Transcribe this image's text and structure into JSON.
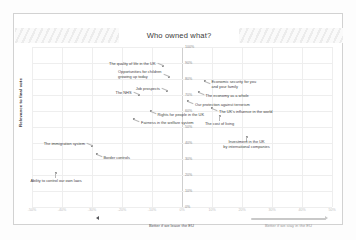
{
  "slide": {
    "title": "Who owned what?"
  },
  "axes": {
    "y_title": "Relevance to final vote",
    "y_ticks": [
      "100%",
      "90%",
      "80%",
      "70%",
      "60%",
      "50%",
      "40%",
      "30%",
      "20%",
      "10%",
      "0%"
    ],
    "y_min": 0,
    "y_max": 100,
    "x_ticks": [
      "-50%",
      "-40%",
      "-30%",
      "-20%",
      "-10%",
      "0%",
      "10%",
      "20%",
      "30%",
      "40%",
      "50%"
    ],
    "x_min": -50,
    "x_max": 50
  },
  "arrows": {
    "leave": {
      "label": "Better if we leave the EU",
      "color": "#55565a"
    },
    "stay": {
      "label": "Better if we stay in the EU",
      "color": "#c9c9c9"
    }
  },
  "chart_data": {
    "type": "scatter",
    "title": "Who owned what?",
    "xlabel": "",
    "ylabel": "Relevance to final vote",
    "xlim": [
      -50,
      50
    ],
    "ylim": [
      0,
      100
    ],
    "grid": true,
    "legend": "none",
    "points": [
      {
        "label": "The quality of life in the UK",
        "x": -6.5,
        "y": 88,
        "label_side": "left"
      },
      {
        "label": "Opportunities for children growing up today",
        "x": -4.5,
        "y": 81,
        "label_side": "left"
      },
      {
        "label": "Economic security for you and your family",
        "x": 7.5,
        "y": 79,
        "label_side": "right"
      },
      {
        "label": "The NHS",
        "x": -14.5,
        "y": 70,
        "label_side": "left"
      },
      {
        "label": "Job prospects",
        "x": -5.0,
        "y": 72.5,
        "label_side": "left"
      },
      {
        "label": "The economy as a whole",
        "x": 5.5,
        "y": 72,
        "label_side": "right"
      },
      {
        "label": "Our protection against terrorism",
        "x": 2.0,
        "y": 66,
        "label_side": "right"
      },
      {
        "label": "The UK's influence in the world",
        "x": 10.0,
        "y": 62,
        "label_side": "right"
      },
      {
        "label": "Rights for people in the UK",
        "x": -10.5,
        "y": 60,
        "label_side": "right"
      },
      {
        "label": "The cost of living",
        "x": 12.5,
        "y": 57,
        "label_side": "center"
      },
      {
        "label": "Fairness in the welfare system",
        "x": -16.0,
        "y": 55,
        "label_side": "right"
      },
      {
        "label": "Investment in the UK by international companies",
        "x": 21.5,
        "y": 44,
        "label_side": "center"
      },
      {
        "label": "The immigration system",
        "x": -30.0,
        "y": 38,
        "label_side": "left"
      },
      {
        "label": "Border controls",
        "x": -28.5,
        "y": 33,
        "label_side": "right"
      },
      {
        "label": "Ability to control our own laws",
        "x": -42.0,
        "y": 21,
        "label_side": "center"
      }
    ]
  }
}
